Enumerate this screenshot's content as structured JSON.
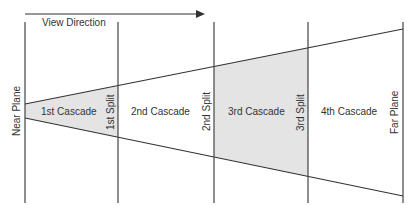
{
  "diagram": {
    "view_direction_label": "View Direction",
    "near_plane_label": "Near Plane",
    "far_plane_label": "Far Plane",
    "splits": [
      {
        "label": "1st Split"
      },
      {
        "label": "2nd Split"
      },
      {
        "label": "3rd Split"
      }
    ],
    "cascades": [
      {
        "label": "1st Cascade",
        "shaded": true
      },
      {
        "label": "2nd Cascade",
        "shaded": false
      },
      {
        "label": "3rd Cascade",
        "shaded": true
      },
      {
        "label": "4th Cascade",
        "shaded": false
      }
    ],
    "colors": {
      "line": "#333333",
      "shade": "#e4e4e4",
      "text": "#333333"
    }
  }
}
